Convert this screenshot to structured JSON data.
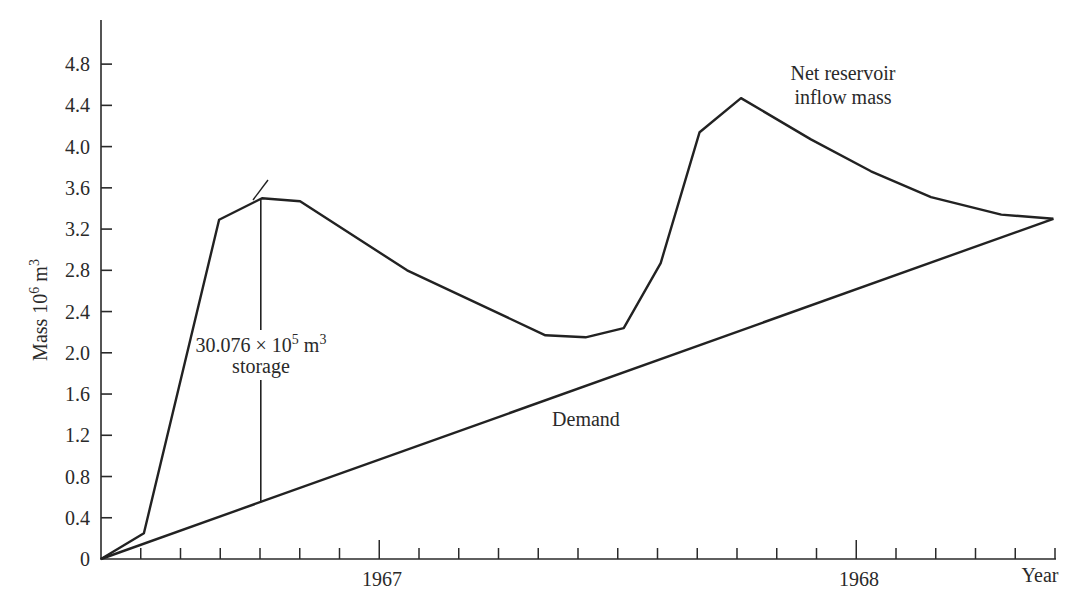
{
  "chart_data": {
    "type": "line",
    "title": "",
    "xlabel": "Year",
    "ylabel": "Mass 10^6 m^3",
    "ylabel_parts": {
      "main": "Mass 10",
      "exp1": "6",
      "unit": " m",
      "exp2": "3"
    },
    "ylim": [
      0,
      4.8
    ],
    "yticks": [
      "0",
      "0.4",
      "0.8",
      "1.2",
      "1.6",
      "2.0",
      "2.4",
      "2.8",
      "3.2",
      "3.6",
      "4.0",
      "4.4",
      "4.8"
    ],
    "ytick_values": [
      0,
      0.4,
      0.8,
      1.2,
      1.6,
      2.0,
      2.4,
      2.8,
      3.2,
      3.6,
      4.0,
      4.4,
      4.8
    ],
    "xlim_months": [
      0,
      24
    ],
    "x_major_labels": [
      {
        "label": "1967",
        "month": 7
      },
      {
        "label": "1968",
        "month": 19
      }
    ],
    "x_end_label": "Year",
    "grid": false,
    "series": [
      {
        "name": "Net reservoir inflow mass",
        "label_lines": [
          "Net reservoir",
          "inflow mass"
        ],
        "points": [
          {
            "x": 0,
            "y": 0
          },
          {
            "x": 1.08,
            "y": 0.25
          },
          {
            "x": 2.97,
            "y": 3.29
          },
          {
            "x": 4.05,
            "y": 3.5
          },
          {
            "x": 5.01,
            "y": 3.47
          },
          {
            "x": 7.7,
            "y": 2.8
          },
          {
            "x": 11.18,
            "y": 2.17
          },
          {
            "x": 12.19,
            "y": 2.15
          },
          {
            "x": 13.15,
            "y": 2.24
          },
          {
            "x": 14.08,
            "y": 2.87
          },
          {
            "x": 15.06,
            "y": 4.14
          },
          {
            "x": 16.1,
            "y": 4.47
          },
          {
            "x": 17.86,
            "y": 4.07
          },
          {
            "x": 19.37,
            "y": 3.76
          },
          {
            "x": 20.88,
            "y": 3.51
          },
          {
            "x": 22.65,
            "y": 3.34
          },
          {
            "x": 23.96,
            "y": 3.3
          }
        ]
      },
      {
        "name": "Demand",
        "label_lines": [
          "Demand"
        ],
        "points": [
          {
            "x": 0,
            "y": 0
          },
          {
            "x": 23.96,
            "y": 3.3
          }
        ]
      }
    ],
    "annotations": [
      {
        "text_line1_main": "30.076 × 10",
        "text_line1_exp": "5",
        "text_line1_unit": " m",
        "text_line1_exp2": "3",
        "text_line2": "storage",
        "full_text": "30.076 × 10^5 m^3 storage",
        "type": "vertical-span",
        "x": 4.02,
        "y_from": 0.55,
        "y_to": 3.5
      }
    ]
  }
}
